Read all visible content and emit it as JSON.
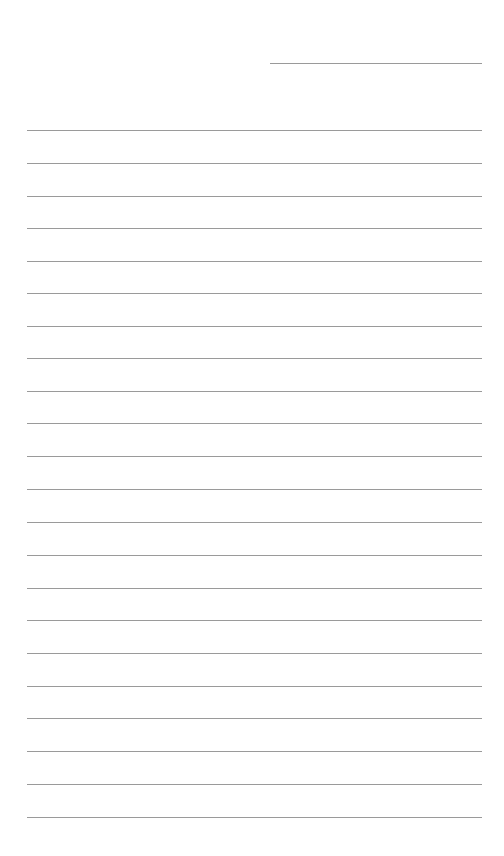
{
  "page": {
    "type": "lined-paper",
    "background_color": "#ffffff",
    "line_color": "#9a9a9a",
    "header_line": {
      "y": 63,
      "x_start": 270,
      "x_end": 482
    },
    "ruled_lines": {
      "count": 22,
      "x_start": 27,
      "x_end": 482,
      "y_positions": [
        130,
        163,
        196,
        228,
        261,
        293,
        326,
        358,
        391,
        423,
        456,
        489,
        522,
        555,
        588,
        620,
        653,
        686,
        718,
        751,
        784,
        817
      ]
    }
  }
}
